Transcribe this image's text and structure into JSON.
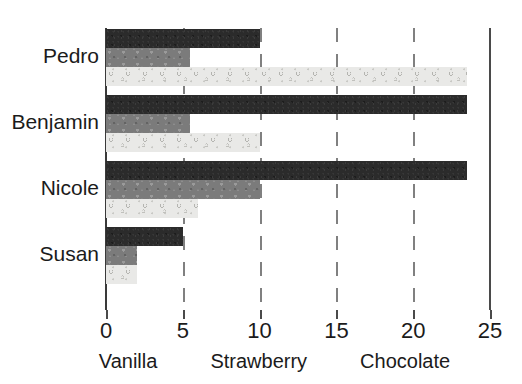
{
  "chart_data": {
    "type": "bar",
    "orientation": "horizontal",
    "title": "",
    "xlabel": "",
    "ylabel": "",
    "xlim": [
      0,
      25
    ],
    "xticks": [
      0,
      5,
      10,
      15,
      20,
      25
    ],
    "xtick_labels": [
      "0",
      "5",
      "10",
      "15",
      "20",
      "25"
    ],
    "grid": true,
    "grid_axis": "x",
    "grid_style": "dashed",
    "legend_position": "bottom",
    "categories": [
      "Pedro",
      "Benjamin",
      "Nicole",
      "Susan"
    ],
    "series": [
      {
        "name": "Vanilla",
        "color": "#e9e9e7",
        "pattern": "circles",
        "values": [
          23.5,
          10,
          6,
          2
        ]
      },
      {
        "name": "Strawberry",
        "color": "#7b7b7b",
        "pattern": "speckle",
        "values": [
          5.5,
          5.5,
          10,
          2
        ]
      },
      {
        "name": "Chocolate",
        "color": "#2b2b2b",
        "pattern": "dense-speckle",
        "values": [
          10,
          23.5,
          23.5,
          5
        ]
      }
    ]
  },
  "legend": {
    "items": [
      {
        "label": "Vanilla"
      },
      {
        "label": "Strawberry"
      },
      {
        "label": "Chocolate"
      }
    ]
  },
  "axis": {
    "tick_labels": [
      "0",
      "5",
      "10",
      "15",
      "20",
      "25"
    ],
    "category_labels": [
      "Pedro",
      "Benjamin",
      "Nicole",
      "Susan"
    ]
  }
}
